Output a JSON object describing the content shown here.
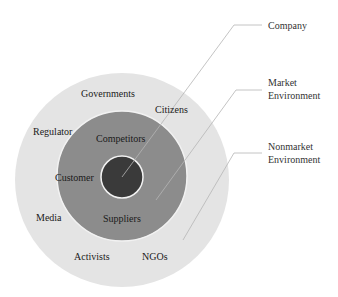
{
  "diagram": {
    "type": "concentric-circles",
    "colors": {
      "outer_ring": "#e4e4e4",
      "middle_ring": "#8c8c8c",
      "inner_core": "#3a3a3a",
      "ring_border": "#f2f2f2",
      "leader_line": "#b5b5b5"
    },
    "callouts": [
      {
        "id": "company",
        "lines": [
          "Company"
        ]
      },
      {
        "id": "market",
        "lines": [
          "Market",
          "Environment"
        ]
      },
      {
        "id": "nonmarket",
        "lines": [
          "Nonmarket",
          "Environment"
        ]
      }
    ],
    "market_labels": {
      "competitors": "Competitors",
      "customer": "Customer",
      "suppliers": "Suppliers"
    },
    "nonmarket_labels": {
      "governments": "Governments",
      "citizens": "Citizens",
      "regulator": "Regulator",
      "media": "Media",
      "activists": "Activists",
      "ngos": "NGOs"
    }
  }
}
